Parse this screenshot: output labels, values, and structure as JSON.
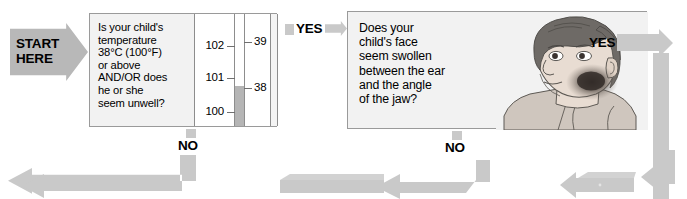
{
  "flowchart": {
    "title": "Childhood fever / facial swelling triage flowchart",
    "start": {
      "label": "START\nHERE",
      "name": "start-here-marker"
    },
    "steps": [
      {
        "id": "temperature",
        "question": "Is your child's\ntemperature\n38°C (100°F)\nor above\nAND/OR does\nhe or she\nseem unwell?",
        "yes_label": "YES",
        "no_label": "NO",
        "graphic": "thermometer"
      },
      {
        "id": "face",
        "question": "Does your\nchild's face\nseem swollen\nbetween the ear\nand the angle\nof the jaw?",
        "yes_label": "YES",
        "no_label": "NO",
        "graphic": "child-face-swelling"
      }
    ],
    "thermometer": {
      "fahrenheit_ticks": [
        "102",
        "101",
        "100"
      ],
      "celsius_ticks": [
        "39",
        "38"
      ],
      "mercury_level_label": "38",
      "unit_f": "°F",
      "unit_c": "°C"
    },
    "colors": {
      "arrow": "#c9c9c9",
      "start_marker": "#b8b8b8",
      "box_fill": "#f2f2f2",
      "box_border": "#9a9a9a",
      "mercury": "#b5b5b5",
      "text": "#000000",
      "skin": "#e8dcd2",
      "hair": "#6e6a66",
      "shirt": "#cfc6be",
      "swelling": "#3a3330"
    }
  }
}
